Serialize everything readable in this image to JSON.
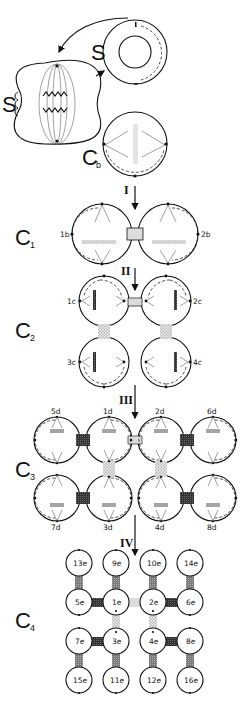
{
  "title": "",
  "stages": {
    "s_metaphase": {
      "label": "S"
    },
    "s_interphase": {
      "label": "S"
    },
    "cb": {
      "label": "C",
      "sub": "b"
    },
    "c1": {
      "label": "C",
      "sub": "1"
    },
    "c2": {
      "label": "C",
      "sub": "2"
    },
    "c3": {
      "label": "C",
      "sub": "3"
    },
    "c4": {
      "label": "C",
      "sub": "4"
    }
  },
  "divisions": [
    "I",
    "II",
    "III",
    "IV"
  ],
  "c1_cells": [
    "1b",
    "2b"
  ],
  "c2_cells": [
    "1c",
    "2c",
    "3c",
    "4c"
  ],
  "c3_cells_top": [
    "5d",
    "1d",
    "2d",
    "6d"
  ],
  "c3_cells_bottom": [
    "7d",
    "3d",
    "4d",
    "8d"
  ],
  "c4_cells": [
    [
      "13e",
      "9e",
      "10e",
      "14e"
    ],
    [
      "5e",
      "1e",
      "2e",
      "6e"
    ],
    [
      "7e",
      "3e",
      "4e",
      "8e"
    ],
    [
      "15e",
      "11e",
      "12e",
      "16e"
    ]
  ],
  "colors": {
    "outline": "#111111",
    "bridge_light": "#d8d8d8",
    "bridge_stipple": "#b5b5b5",
    "bridge_dark": "#3a3a3a",
    "bridge_mid": "#8a8a8a",
    "plate": "#a0a0a0"
  }
}
